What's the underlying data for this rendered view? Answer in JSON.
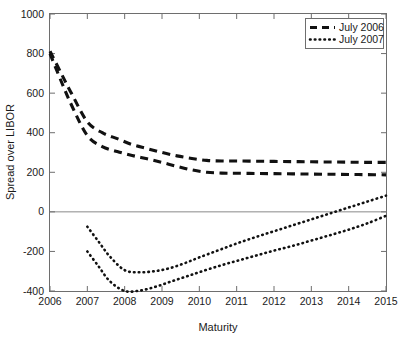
{
  "chart_data": {
    "type": "line",
    "title": "",
    "xlabel": "Maturity",
    "ylabel": "Spread over LIBOR",
    "xlim": [
      2006,
      2015
    ],
    "ylim": [
      -400,
      1000
    ],
    "xticks": [
      2006,
      2007,
      2008,
      2009,
      2010,
      2011,
      2012,
      2013,
      2014,
      2015
    ],
    "yticks": [
      -400,
      -200,
      0,
      200,
      400,
      600,
      800,
      1000
    ],
    "xtick_labels": [
      "2006",
      "2007",
      "2008",
      "2009",
      "2010",
      "2011",
      "2012",
      "2013",
      "2014",
      "2015"
    ],
    "ytick_labels": [
      "-400",
      "-200",
      "0",
      "200",
      "400",
      "600",
      "800",
      "1000"
    ],
    "grid": false,
    "zero_line": true,
    "legend_position": "top-right",
    "legend_entries": [
      "July 2006",
      "July 2007"
    ],
    "series": [
      {
        "name": "July 2006 upper",
        "legend": "July 2006",
        "style": "dashed",
        "x": [
          2006.0,
          2006.3,
          2006.6,
          2007.0,
          2007.4,
          2007.8,
          2008.2,
          2008.6,
          2009.0,
          2009.4,
          2009.8,
          2010.2,
          2010.6,
          2011.0,
          2011.5,
          2012.0,
          2012.5,
          2013.0,
          2013.5,
          2014.0,
          2014.5,
          2015.0
        ],
        "y": [
          812,
          700,
          590,
          455,
          400,
          370,
          340,
          320,
          300,
          283,
          270,
          260,
          257,
          257,
          256,
          255,
          254,
          253,
          252,
          251,
          250,
          250
        ]
      },
      {
        "name": "July 2006 lower",
        "legend": "July 2006",
        "style": "dashed",
        "x": [
          2006.0,
          2006.3,
          2006.6,
          2007.0,
          2007.4,
          2007.8,
          2008.2,
          2008.6,
          2009.0,
          2009.4,
          2009.8,
          2010.2,
          2010.6,
          2011.0,
          2011.5,
          2012.0,
          2012.5,
          2013.0,
          2013.5,
          2014.0,
          2014.5,
          2015.0
        ],
        "y": [
          800,
          660,
          530,
          385,
          330,
          305,
          285,
          268,
          250,
          230,
          212,
          200,
          196,
          195,
          194,
          193,
          192,
          191,
          190,
          189,
          188,
          187
        ]
      },
      {
        "name": "July 2007 upper",
        "legend": "July 2007",
        "style": "dotted",
        "x": [
          2007.0,
          2007.3,
          2007.6,
          2008.0,
          2008.4,
          2008.8,
          2009.2,
          2009.6,
          2010.0,
          2010.5,
          2011.0,
          2011.5,
          2012.0,
          2012.5,
          2013.0,
          2013.5,
          2014.0,
          2014.5,
          2015.0
        ],
        "y": [
          -75,
          -150,
          -225,
          -295,
          -305,
          -300,
          -285,
          -260,
          -230,
          -195,
          -160,
          -128,
          -98,
          -68,
          -38,
          -8,
          22,
          52,
          82
        ]
      },
      {
        "name": "July 2007 lower",
        "legend": "July 2007",
        "style": "dotted",
        "x": [
          2007.0,
          2007.3,
          2007.6,
          2008.0,
          2008.4,
          2008.8,
          2009.2,
          2009.6,
          2010.0,
          2010.5,
          2011.0,
          2011.5,
          2012.0,
          2012.5,
          2013.0,
          2013.5,
          2014.0,
          2014.5,
          2015.0
        ],
        "y": [
          -200,
          -275,
          -350,
          -400,
          -398,
          -380,
          -355,
          -330,
          -305,
          -275,
          -248,
          -222,
          -196,
          -172,
          -145,
          -118,
          -90,
          -58,
          -20
        ]
      }
    ]
  },
  "colors": {
    "line": "#111111",
    "axis": "#6e6e6e",
    "background": "#ffffff",
    "text": "#1a1a1a"
  },
  "axes": {
    "x_title": "Maturity",
    "y_title": "Spread over LIBOR"
  },
  "legend": {
    "items": [
      {
        "label": "July 2006",
        "style": "dashed"
      },
      {
        "label": "July 2007",
        "style": "dotted"
      }
    ]
  }
}
